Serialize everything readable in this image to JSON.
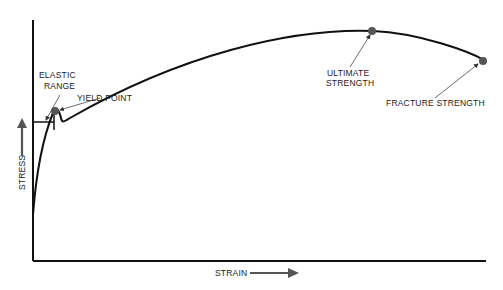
{
  "diagram": {
    "axes": {
      "x_label": "STRAIN",
      "y_label": "STRESS"
    },
    "annotations": {
      "elastic_range_line1": "ELASTIC",
      "elastic_range_line2": "RANGE",
      "yield_point": "YIELD POINT",
      "ultimate_strength_line1": "ULTIMATE",
      "ultimate_strength_line2": "STRENGTH",
      "fracture_strength": "FRACTURE STRENGTH"
    },
    "colors": {
      "curve": "#111111",
      "axes": "#111111",
      "point_marker": "#555555",
      "arrow": "#555555",
      "text": "#222222"
    }
  }
}
